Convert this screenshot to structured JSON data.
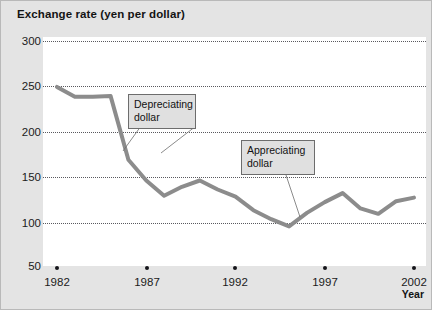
{
  "chart_data": {
    "type": "line",
    "title": "Exchange rate (yen per dollar)",
    "xlabel": "Year",
    "ylabel": "",
    "ylim": [
      50,
      300
    ],
    "xlim": [
      1982,
      2002
    ],
    "grid": true,
    "legend_position": "none",
    "ytick_labels": [
      "300",
      "250",
      "200",
      "150",
      "100",
      "50"
    ],
    "ytick_values": [
      300,
      250,
      200,
      150,
      100,
      50
    ],
    "xtick_labels": [
      "1982",
      "1987",
      "1992",
      "1997",
      "2002"
    ],
    "xtick_values": [
      1982,
      1987,
      1992,
      1997,
      2002
    ],
    "x": [
      1982,
      1983,
      1984,
      1985,
      1986,
      1987,
      1988,
      1989,
      1990,
      1991,
      1992,
      1993,
      1994,
      1995,
      1996,
      1997,
      1998,
      1999,
      2000,
      2001,
      2002
    ],
    "values": [
      249,
      238,
      238,
      239,
      168,
      145,
      128,
      138,
      145,
      135,
      127,
      112,
      102,
      94,
      109,
      121,
      131,
      114,
      108,
      122,
      126
    ],
    "series_color": "#8c8c8c",
    "annotations": [
      {
        "label": "Depreciating\ndollar",
        "points_to_x": 1986,
        "points_to_y": 196
      },
      {
        "label": "Appreciating\ndollar",
        "points_to_x": 1996,
        "points_to_y": 112
      }
    ]
  },
  "figure": {
    "background_color": "#e4e4e4",
    "plot_background_color": "#ffffff",
    "grid_color": "#59595e"
  }
}
